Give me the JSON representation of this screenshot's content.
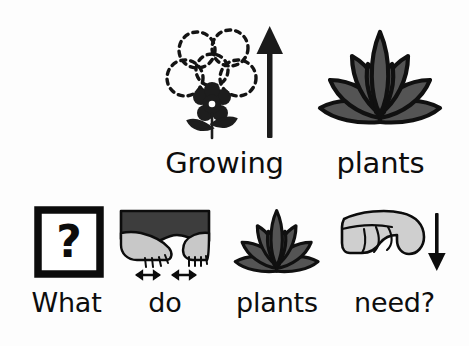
{
  "page": {
    "type": "symbol-supported-text-card",
    "background_color": "#ffffff",
    "text_color": "#0d0d0d",
    "ink_color": "#111111",
    "leaf_fill": "#545454",
    "sleeve_fill": "#3d3d3d",
    "skin_fill": "#c8c8c8",
    "flower_fill": "#2b2b2b"
  },
  "title_row": {
    "items": [
      {
        "id": "growing",
        "label": "Growing",
        "symbol": "flower-growing-up-arrow-icon",
        "symbol_description": "small solid flower with large dashed outline flower above it and an upward arrow"
      },
      {
        "id": "plants_title",
        "label": "plants",
        "symbol": "leafy-plant-icon",
        "symbol_description": "bushy plant with gray pointed leaves outlined in black"
      }
    ]
  },
  "question_row": {
    "sentence": "What do plants need?",
    "items": [
      {
        "id": "what",
        "label": "What",
        "symbol": "question-mark-box-icon",
        "symbol_description": "question mark inside a thick black square outline"
      },
      {
        "id": "do",
        "label": "do",
        "symbol": "two-hands-doing-icon",
        "symbol_description": "two hands in dark sleeves with small double-headed arrows beneath"
      },
      {
        "id": "plants",
        "label": "plants",
        "symbol": "leafy-plant-icon",
        "symbol_description": "bushy plant with gray pointed leaves outlined in black"
      },
      {
        "id": "need",
        "label": "need?",
        "symbol": "hand-pointing-down-icon",
        "symbol_description": "light gray hand pointing downward with a down arrow beside it"
      }
    ]
  }
}
